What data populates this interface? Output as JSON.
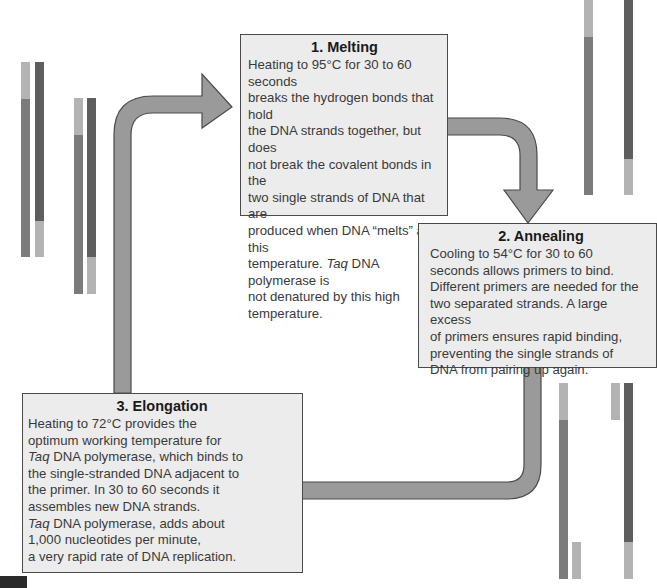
{
  "steps": [
    {
      "heading": "1. Melting",
      "lines": [
        "Heating to 95°C for 30 to 60 seconds",
        "breaks the hydrogen bonds that hold",
        "the DNA strands together, but does",
        "not break the covalent bonds in the",
        "two single strands of DNA that are",
        "produced when DNA “melts” at this",
        "temperature. |Taq| DNA polymerase is",
        "not denatured by this high",
        "temperature."
      ]
    },
    {
      "heading": "2. Annealing",
      "lines": [
        "Cooling to 54°C for 30 to 60",
        "seconds allows primers to bind.",
        "Different primers are needed for the",
        "two separated strands. A large excess",
        "of primers ensures rapid binding,",
        "preventing the single strands of",
        "DNA from pairing up again."
      ]
    },
    {
      "heading": "3. Elongation",
      "lines": [
        "Heating to 72°C provides the",
        "optimum working temperature for",
        "|Taq| DNA polymerase, which binds to",
        "the single-stranded DNA adjacent to",
        "the primer. In 30 to 60 seconds it",
        "assembles new DNA strands.",
        "|Taq| DNA polymerase, adds about",
        "1,000 nucleotides per minute,",
        "a very rapid rate of DNA replication."
      ]
    }
  ],
  "colors": {
    "strand_light": "#b3b3b3",
    "strand_mid": "#7b7b7b",
    "strand_dark": "#5e5e5e",
    "arrow_fill": "#9a9a9a",
    "arrow_stroke": "#4a4a4a",
    "box_fill": "#ececec"
  }
}
